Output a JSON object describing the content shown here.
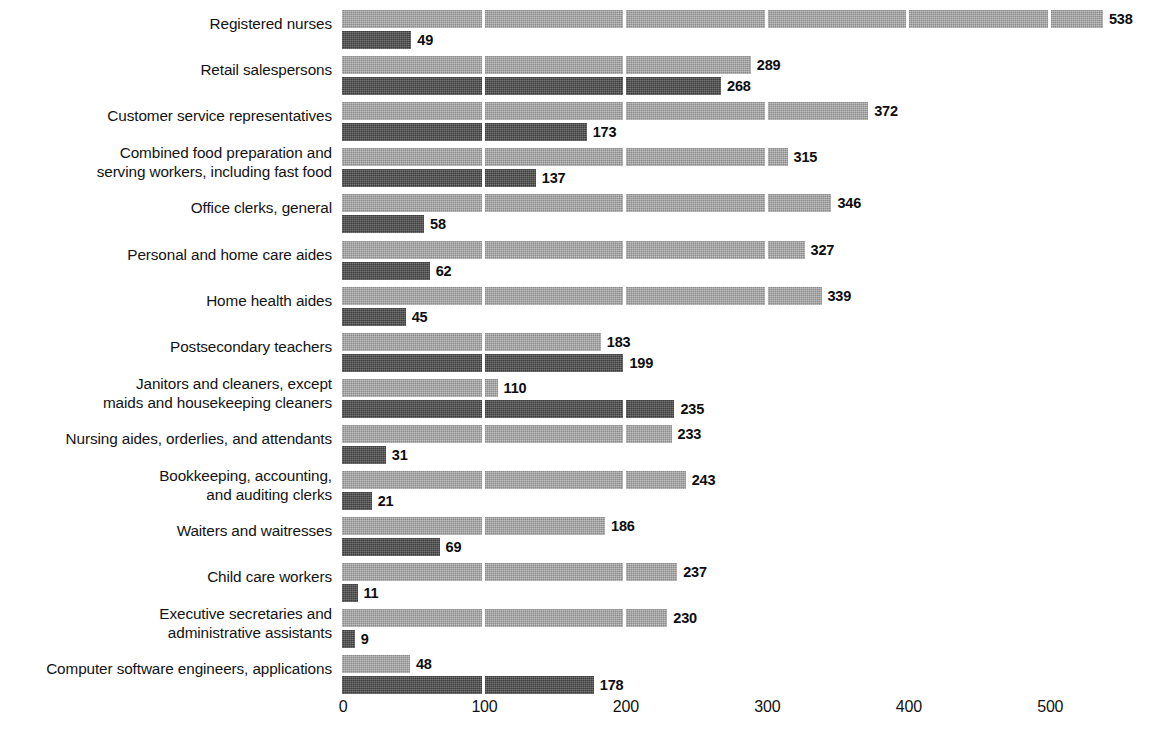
{
  "chart_data": {
    "type": "bar",
    "orientation": "horizontal",
    "title": "",
    "subtitle": "",
    "xlabel": "",
    "ylabel": "",
    "xlim": [
      0,
      560
    ],
    "xticks": [
      0,
      100,
      200,
      300,
      400,
      500
    ],
    "xticklabels": [
      "0",
      "100",
      "200",
      "300",
      "400",
      "500"
    ],
    "grid": true,
    "grid_orientation": "vertical",
    "grid_color": "#ffffff",
    "legend": null,
    "series": [
      {
        "name": "light-series",
        "color": "#9b9b9b",
        "values": [
          538,
          289,
          372,
          315,
          346,
          327,
          339,
          183,
          110,
          233,
          243,
          186,
          237,
          230,
          48
        ]
      },
      {
        "name": "dark-series",
        "color": "#4b4b4b",
        "values": [
          49,
          268,
          173,
          137,
          58,
          62,
          45,
          199,
          235,
          31,
          21,
          69,
          11,
          9,
          178
        ]
      }
    ],
    "categories": [
      "Registered nurses",
      "Retail salespersons",
      "Customer service representatives",
      "Combined food preparation and\nserving workers, including fast food",
      "Office clerks, general",
      "Personal and home care aides",
      "Home health aides",
      "Postsecondary teachers",
      "Janitors and cleaners, except\nmaids and housekeeping cleaners",
      "Nursing aides, orderlies, and attendants",
      "Bookkeeping, accounting,\nand auditing clerks",
      "Waiters and waitresses",
      "Child care workers",
      "Executive secretaries and\nadministrative assistants",
      "Computer software engineers, applications"
    ],
    "data_labels": {
      "light": [
        "538",
        "289",
        "372",
        "315",
        "346",
        "327",
        "339",
        "183",
        "110",
        "233",
        "243",
        "186",
        "237",
        "230",
        "48"
      ],
      "dark": [
        "49",
        "268",
        "173",
        "137",
        "58",
        "62",
        "45",
        "199",
        "235",
        "31",
        "21",
        "69",
        "11",
        "9",
        "178"
      ]
    }
  },
  "rows": [
    {
      "label": "Registered nurses",
      "light": 538,
      "dark": 49,
      "light_label": "538",
      "dark_label": "49"
    },
    {
      "label": "Retail salespersons",
      "light": 289,
      "dark": 268,
      "light_label": "289",
      "dark_label": "268"
    },
    {
      "label": "Customer service representatives",
      "light": 372,
      "dark": 173,
      "light_label": "372",
      "dark_label": "173"
    },
    {
      "label": "Combined food preparation and\nserving workers, including fast food",
      "light": 315,
      "dark": 137,
      "light_label": "315",
      "dark_label": "137"
    },
    {
      "label": "Office clerks, general",
      "light": 346,
      "dark": 58,
      "light_label": "346",
      "dark_label": "58"
    },
    {
      "label": "Personal and home care aides",
      "light": 327,
      "dark": 62,
      "light_label": "327",
      "dark_label": "62"
    },
    {
      "label": "Home health aides",
      "light": 339,
      "dark": 45,
      "light_label": "339",
      "dark_label": "45"
    },
    {
      "label": "Postsecondary teachers",
      "light": 183,
      "dark": 199,
      "light_label": "183",
      "dark_label": "199"
    },
    {
      "label": "Janitors and cleaners, except\nmaids and housekeeping cleaners",
      "light": 110,
      "dark": 235,
      "light_label": "110",
      "dark_label": "235"
    },
    {
      "label": "Nursing aides, orderlies, and attendants",
      "light": 233,
      "dark": 31,
      "light_label": "233",
      "dark_label": "31"
    },
    {
      "label": "Bookkeeping, accounting,\nand auditing clerks",
      "light": 243,
      "dark": 21,
      "light_label": "243",
      "dark_label": "21"
    },
    {
      "label": "Waiters and waitresses",
      "light": 186,
      "dark": 69,
      "light_label": "186",
      "dark_label": "69"
    },
    {
      "label": "Child care workers",
      "light": 237,
      "dark": 11,
      "light_label": "237",
      "dark_label": "11"
    },
    {
      "label": "Executive secretaries and\nadministrative assistants",
      "light": 230,
      "dark": 9,
      "light_label": "230",
      "dark_label": "9"
    },
    {
      "label": "Computer software engineers, applications",
      "light": 48,
      "dark": 178,
      "light_label": "48",
      "dark_label": "178"
    }
  ],
  "axis": {
    "ticks": [
      "0",
      "100",
      "200",
      "300",
      "400",
      "500"
    ],
    "tick_values": [
      0,
      100,
      200,
      300,
      400,
      500
    ]
  },
  "colors": {
    "light_bar": "#9b9b9b",
    "dark_bar": "#4b4b4b",
    "text": "#111111",
    "background": "#ffffff"
  }
}
